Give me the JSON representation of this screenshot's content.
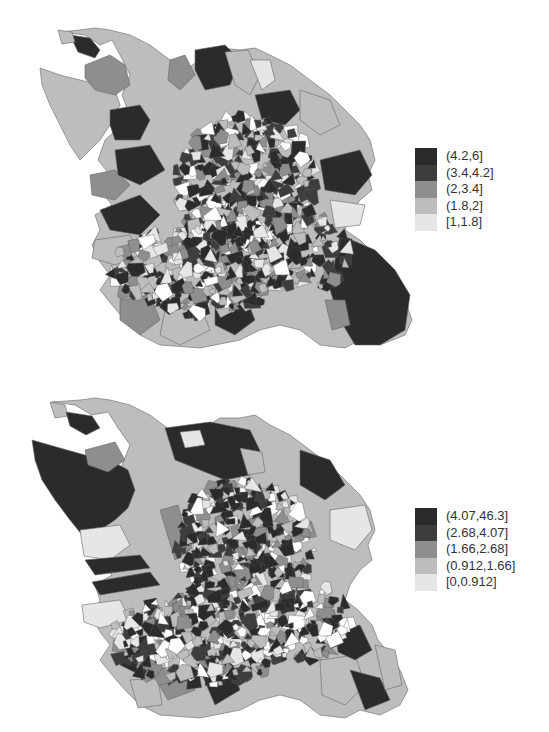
{
  "maps": [
    {
      "id": "top",
      "legend": {
        "entries": [
          {
            "label": "(4.2,6]",
            "color": "#2b2b2b"
          },
          {
            "label": "(3.4,4.2]",
            "color": "#3d3d3d"
          },
          {
            "label": "(2,3.4]",
            "color": "#8e8e8e"
          },
          {
            "label": "(1.8,2]",
            "color": "#bdbdbd"
          },
          {
            "label": "[1,1.8]",
            "color": "#e6e6e6"
          }
        ]
      }
    },
    {
      "id": "bottom",
      "legend": {
        "entries": [
          {
            "label": "(4.07,46.3]",
            "color": "#2b2b2b"
          },
          {
            "label": "(2.68,4.07]",
            "color": "#3d3d3d"
          },
          {
            "label": "(1.66,2.68]",
            "color": "#8e8e8e"
          },
          {
            "label": "(0.912,1.66]",
            "color": "#bdbdbd"
          },
          {
            "label": "[0,0.912]",
            "color": "#e6e6e6"
          }
        ]
      }
    }
  ]
}
